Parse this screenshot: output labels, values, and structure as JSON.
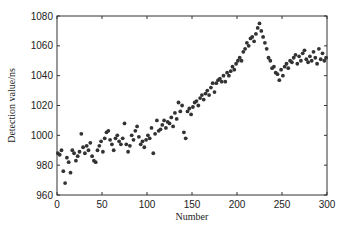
{
  "chart_data": {
    "type": "scatter",
    "title": "",
    "xlabel": "Number",
    "ylabel": "Detection value/ns",
    "xlim": [
      0,
      300
    ],
    "ylim": [
      960,
      1080
    ],
    "xticks": [
      0,
      50,
      100,
      150,
      200,
      250,
      300
    ],
    "yticks": [
      960,
      980,
      1000,
      1020,
      1040,
      1060,
      1080
    ],
    "grid": false,
    "legend": "none",
    "marker_color": "#333333",
    "series": [
      {
        "name": "Detection value",
        "x": [
          1,
          3,
          5,
          7,
          9,
          11,
          13,
          15,
          17,
          19,
          21,
          23,
          25,
          27,
          29,
          31,
          33,
          35,
          37,
          39,
          41,
          43,
          45,
          47,
          49,
          51,
          53,
          55,
          57,
          59,
          61,
          63,
          65,
          67,
          69,
          71,
          73,
          75,
          77,
          79,
          81,
          83,
          85,
          87,
          89,
          91,
          93,
          95,
          97,
          99,
          101,
          103,
          105,
          107,
          109,
          111,
          113,
          115,
          117,
          119,
          121,
          123,
          125,
          127,
          129,
          131,
          133,
          135,
          137,
          139,
          141,
          143,
          145,
          147,
          149,
          151,
          153,
          155,
          157,
          159,
          161,
          163,
          165,
          167,
          169,
          171,
          173,
          175,
          177,
          179,
          181,
          183,
          185,
          187,
          189,
          191,
          193,
          195,
          197,
          199,
          201,
          203,
          205,
          207,
          209,
          211,
          213,
          215,
          217,
          219,
          221,
          223,
          225,
          227,
          229,
          231,
          233,
          235,
          237,
          239,
          241,
          243,
          245,
          247,
          249,
          251,
          253,
          255,
          257,
          259,
          261,
          263,
          265,
          267,
          269,
          271,
          273,
          275,
          277,
          279,
          281,
          283,
          285,
          287,
          289,
          291,
          293,
          295,
          297,
          299
        ],
        "y": [
          988,
          987,
          990,
          976,
          968,
          985,
          982,
          975,
          990,
          988,
          983,
          986,
          989,
          1001,
          992,
          988,
          993,
          990,
          995,
          986,
          983,
          982,
          990,
          993,
          996,
          989,
          998,
          1002,
          1003,
          997,
          994,
          990,
          998,
          1000,
          996,
          994,
          998,
          1008,
          994,
          989,
          993,
          1000,
          997,
          1003,
          1006,
          999,
          994,
          996,
          992,
          997,
          1000,
          998,
          1005,
          988,
          1001,
          1010,
          1003,
          1004,
          1007,
          1010,
          1005,
          1009,
          1008,
          1012,
          1006,
          1015,
          1011,
          1022,
          1016,
          1020,
          1002,
          998,
          1016,
          1018,
          1014,
          1019,
          1022,
          1023,
          1020,
          1025,
          1027,
          1024,
          1028,
          1030,
          1027,
          1032,
          1035,
          1029,
          1035,
          1037,
          1038,
          1036,
          1040,
          1036,
          1042,
          1040,
          1043,
          1046,
          1044,
          1048,
          1050,
          1052,
          1050,
          1056,
          1058,
          1062,
          1060,
          1065,
          1066,
          1063,
          1068,
          1072,
          1075,
          1070,
          1066,
          1062,
          1058,
          1052,
          1050,
          1045,
          1046,
          1042,
          1041,
          1037,
          1044,
          1040,
          1046,
          1048,
          1045,
          1050,
          1049,
          1052,
          1054,
          1048,
          1053,
          1050,
          1055,
          1057,
          1051,
          1049,
          1053,
          1050,
          1056,
          1052,
          1048,
          1058,
          1051,
          1055,
          1050,
          1052
        ]
      }
    ]
  }
}
